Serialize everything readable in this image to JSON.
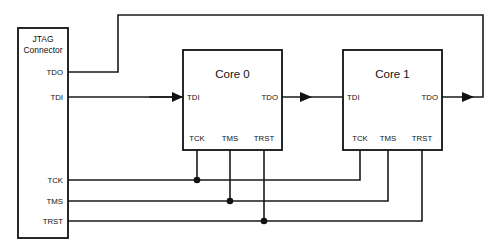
{
  "diagram": {
    "type": "schematic",
    "background_color": "#ffffff",
    "line_color": "#111111",
    "canvas": {
      "width": 503,
      "height": 247
    }
  },
  "connector": {
    "name_line1": "JTAG",
    "name_line2": "Connector",
    "pins": [
      {
        "label": "TDO",
        "y": 72
      },
      {
        "label": "TDI",
        "y": 97
      },
      {
        "label": "TCK",
        "y": 180
      },
      {
        "label": "TMS",
        "y": 201
      },
      {
        "label": "TRST",
        "y": 221
      }
    ]
  },
  "cores": [
    {
      "title": "Core 0",
      "input_pin": "TDI",
      "output_pin": "TDO",
      "bottom_pins": [
        "TCK",
        "TMS",
        "TRST"
      ]
    },
    {
      "title": "Core 1",
      "input_pin": "TDI",
      "output_pin": "TDO",
      "bottom_pins": [
        "TCK",
        "TMS",
        "TRST"
      ]
    }
  ],
  "signals": {
    "tdo": "TDO",
    "tdi": "TDI",
    "tck": "TCK",
    "tms": "TMS",
    "trst": "TRST"
  },
  "junction_count": 3
}
